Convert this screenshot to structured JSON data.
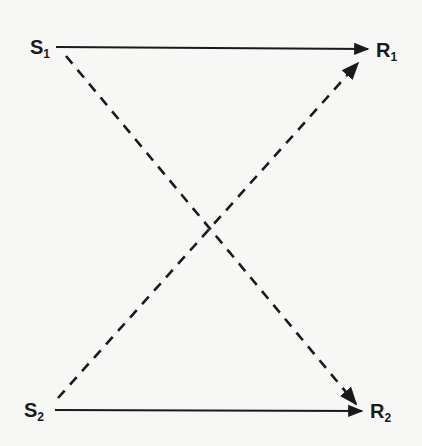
{
  "diagram": {
    "nodes": [
      {
        "id": "S1",
        "base": "S",
        "sub": "1"
      },
      {
        "id": "R1",
        "base": "R",
        "sub": "1"
      },
      {
        "id": "S2",
        "base": "S",
        "sub": "2"
      },
      {
        "id": "R2",
        "base": "R",
        "sub": "2"
      }
    ],
    "edges": [
      {
        "from": "S1",
        "to": "R1",
        "style": "solid"
      },
      {
        "from": "S2",
        "to": "R2",
        "style": "solid"
      },
      {
        "from": "S1",
        "to": "R2",
        "style": "dashed"
      },
      {
        "from": "S2",
        "to": "R1",
        "style": "dashed"
      }
    ],
    "colors": {
      "ink": "#1a1a1a",
      "background": "#f7f7f5"
    }
  }
}
